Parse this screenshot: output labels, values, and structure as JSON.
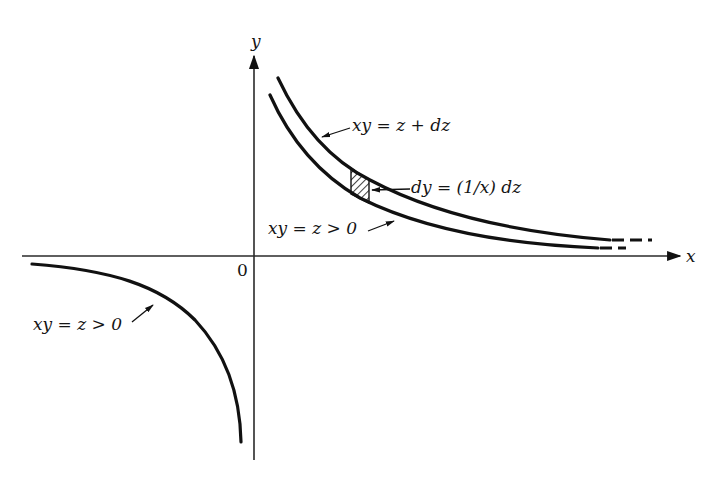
{
  "figure": {
    "axes": {
      "x_label": "x",
      "y_label": "y",
      "origin_label": "0"
    },
    "curves": [
      {
        "id": "upper-outer",
        "equation": "xy = z + dz",
        "quadrant": "first",
        "style": "solid then dashed"
      },
      {
        "id": "upper-inner",
        "equation": "xy = z > 0",
        "quadrant": "first",
        "style": "solid then dashed"
      },
      {
        "id": "lower-left",
        "equation": "xy = z > 0",
        "quadrant": "third",
        "style": "solid"
      }
    ],
    "annotations": {
      "outer_label": "xy = z + dz",
      "strip_label": "dy = (1/x) dz",
      "inner_label": "xy = z > 0",
      "lower_label": "xy = z > 0"
    },
    "strip": {
      "description": "hatched vertical strip between the two upper hyperbolas"
    },
    "colors": {
      "ink": "#111111",
      "background": "#ffffff"
    }
  }
}
